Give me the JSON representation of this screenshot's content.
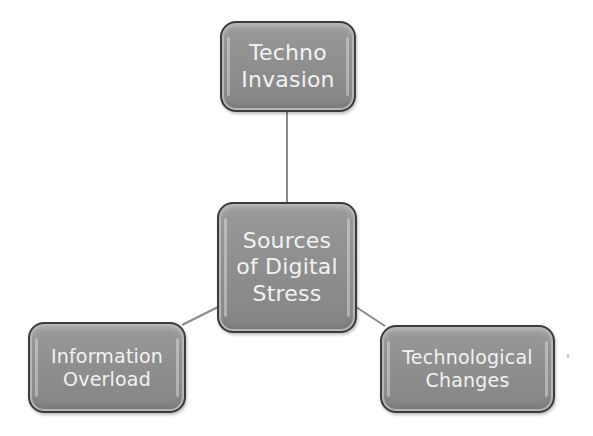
{
  "diagram": {
    "type": "hub-and-spoke",
    "center": {
      "id": "center",
      "label": "Sources\nof Digital\nStress"
    },
    "nodes": [
      {
        "id": "top",
        "label": "Techno\nInvasion"
      },
      {
        "id": "left",
        "label": "Information\nOverload"
      },
      {
        "id": "right",
        "label": "Technological\nChanges"
      }
    ],
    "edges": [
      {
        "from": "center",
        "to": "top"
      },
      {
        "from": "center",
        "to": "left"
      },
      {
        "from": "center",
        "to": "right"
      }
    ],
    "colors": {
      "node_fill": "#8e8e8e",
      "node_border": "#3c3c3c",
      "node_text": "#f2f2f2",
      "connector": "#8a8a8a",
      "background": "#ffffff"
    }
  }
}
